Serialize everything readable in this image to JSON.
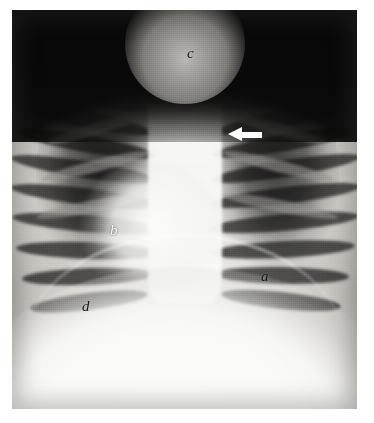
{
  "figure": {
    "kind": "chest-radiograph",
    "modality": "plain film chest X-ray, frontal (PA) projection",
    "frame": {
      "left": 12,
      "top": 10,
      "width": 345,
      "height": 399
    },
    "page_background": "#ffffff",
    "plate_background": "#b9b7b2"
  },
  "annotations": [
    {
      "id": "a",
      "label": "a",
      "name": "annotation-label-a",
      "color": "#131313",
      "tone": "dark",
      "x": 261,
      "y": 269,
      "region": "right lower lung field / cardiophrenic area"
    },
    {
      "id": "b",
      "label": "b",
      "name": "annotation-label-b",
      "color": "#fdfdfd",
      "tone": "light",
      "x": 110,
      "y": 223,
      "region": "left mid lung field between posterior ribs"
    },
    {
      "id": "c",
      "label": "c",
      "name": "annotation-label-c",
      "color": "#131313",
      "tone": "dark",
      "x": 187,
      "y": 46,
      "region": "superior mediastinum / tracheal air column"
    },
    {
      "id": "d",
      "label": "d",
      "name": "annotation-label-d",
      "color": "#131313",
      "tone": "dark",
      "x": 82,
      "y": 299,
      "region": "left hemidiaphragm dome"
    }
  ],
  "markers": [
    {
      "id": "arrow-1",
      "name": "pointer-arrow-marker",
      "shape": "solid-left-pointing-arrow",
      "color": "#ffffff",
      "x": 228,
      "y": 127,
      "width": 34,
      "height": 15,
      "direction": "left",
      "points_at": "right upper lung field, third intercostal space"
    }
  ],
  "anatomy": {
    "air_field_top": "black air space above both shoulders",
    "lung_fields": [
      "left lung field",
      "right lung field"
    ],
    "mediastinum": "bright central mediastinal and spinal column",
    "heart": "cardiac silhouette, left of midline",
    "diaphragm": "bright sub-diaphragmatic / abdominal field at base",
    "ribs_per_side": 9,
    "clavicles": 2
  }
}
